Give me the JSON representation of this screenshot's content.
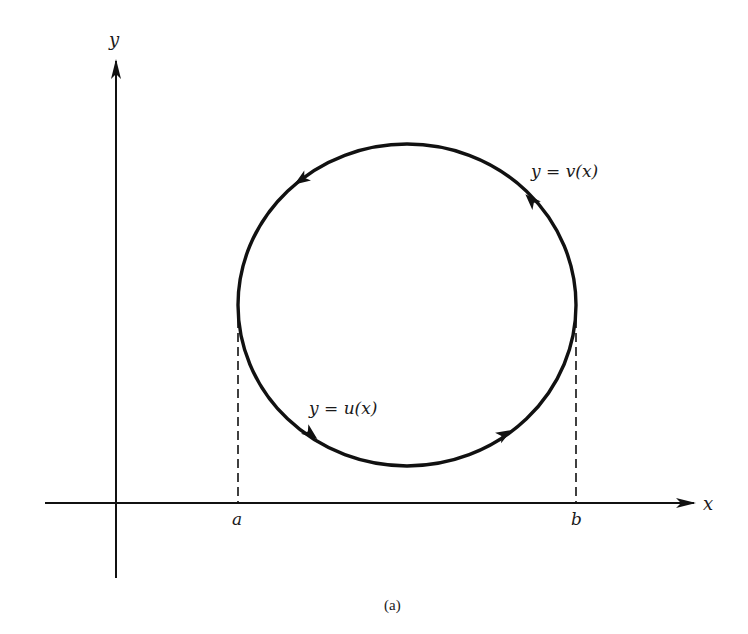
{
  "figure": {
    "caption": "(a)",
    "axes": {
      "x_label": "x",
      "y_label": "y",
      "origin": [
        116,
        503
      ],
      "x_axis": {
        "from": 45,
        "to": 695
      },
      "y_axis": {
        "from": 578,
        "to": 60
      }
    },
    "curve": {
      "shape": "closed-circle",
      "center": [
        407,
        305
      ],
      "rx": 169,
      "ry": 161,
      "orientation": "counterclockwise",
      "upper_label": "y = v(x)",
      "lower_label": "y = u(x)"
    },
    "bounds": {
      "a_label": "a",
      "b_label": "b",
      "a_x": 238,
      "b_x": 576
    },
    "colors": {
      "ink": "#111111",
      "background": "#ffffff"
    }
  }
}
